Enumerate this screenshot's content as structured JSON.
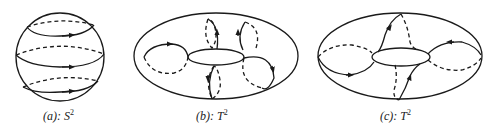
{
  "figures": [
    {
      "id": "a",
      "label_prefix": "(a):",
      "label_symbol": "S",
      "label_exp": "2",
      "surface": "sphere"
    },
    {
      "id": "b",
      "label_prefix": "(b):",
      "label_symbol": "T",
      "label_exp": "2",
      "surface": "torus"
    },
    {
      "id": "c",
      "label_prefix": "(c):",
      "label_symbol": "T",
      "label_exp": "2",
      "surface": "torus"
    }
  ],
  "colors": {
    "stroke": "#1a1a1a",
    "background": "#ffffff"
  }
}
